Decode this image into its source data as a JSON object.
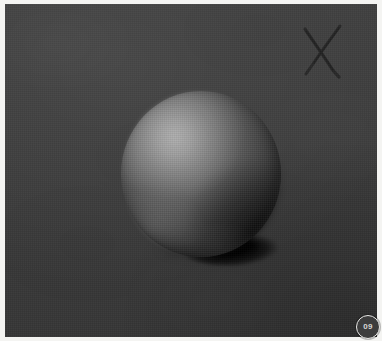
{
  "artwork": {
    "title": "Shaded Sphere Study",
    "medium": "graphite / charcoal value study",
    "canvas": {
      "width_px": 382,
      "height_px": 341
    },
    "palette": {
      "mat_border": "#f4f4f2",
      "ground_dark": "#3b3b3b",
      "ground_light": "#3e3e3e",
      "sphere_highlight": "#8e8e8e",
      "sphere_midtone": "#5d5d5d",
      "sphere_core_shadow": "#1f1f1f",
      "cast_shadow": "#000000",
      "x_mark": "#272727",
      "badge_text": "#d8d8d6"
    },
    "elements": {
      "ground": {
        "name": "Toned ground",
        "description": "Dark gray textured canvas with light falling from upper left"
      },
      "sphere": {
        "name": "Sphere",
        "description": "Value-rendered ball with highlight, midtone, core shadow and reflected light",
        "center_x": 196,
        "center_y": 170,
        "radius_px": 80
      },
      "cast_shadow": {
        "name": "Cast shadow",
        "description": "Elongated dark ellipse thrown to the right of the sphere base"
      },
      "x_mark": {
        "name": "X mark",
        "description": "Hand-drawn cross in the upper right corner"
      }
    }
  },
  "badge": {
    "label": "09",
    "name": "page-number-badge"
  }
}
